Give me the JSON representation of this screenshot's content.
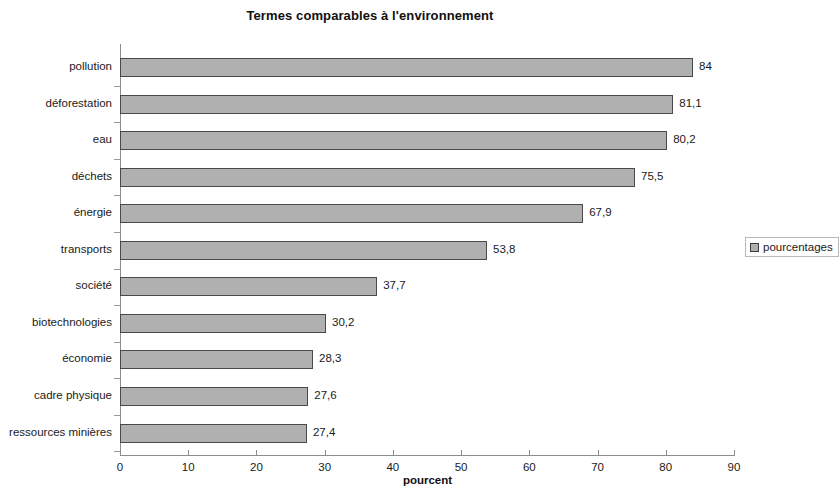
{
  "chart_data": {
    "type": "bar",
    "orientation": "horizontal",
    "title": "Termes comparables à l'environnement",
    "xlabel": "pourcent",
    "ylabel": "",
    "categories": [
      "pollution",
      "déforestation",
      "eau",
      "déchets",
      "énergie",
      "transports",
      "société",
      "biotechnologies",
      "économie",
      "cadre physique",
      "ressources minières"
    ],
    "values": [
      84,
      81.1,
      80.2,
      75.5,
      67.9,
      53.8,
      37.7,
      30.2,
      28.3,
      27.6,
      27.4
    ],
    "value_labels": [
      "84",
      "81,1",
      "80,2",
      "75,5",
      "67,9",
      "53,8",
      "37,7",
      "30,2",
      "28,3",
      "27,6",
      "27,4"
    ],
    "series": [
      {
        "name": "pourcentages",
        "values": [
          84,
          81.1,
          80.2,
          75.5,
          67.9,
          53.8,
          37.7,
          30.2,
          28.3,
          27.6,
          27.4
        ]
      }
    ],
    "xlim": [
      0,
      90
    ],
    "xticks": [
      0,
      10,
      20,
      30,
      40,
      50,
      60,
      70,
      80,
      90
    ],
    "xtick_labels": [
      "0",
      "10",
      "20",
      "30",
      "40",
      "50",
      "60",
      "70",
      "80",
      "90"
    ],
    "grid": false,
    "legend": {
      "position": "right",
      "entries": [
        "pourcentages"
      ]
    },
    "colors": {
      "bar_fill": "#b0b0b0",
      "bar_border": "#494949",
      "axis": "#8d8d8d",
      "text": "#1a1a1a",
      "background": "#ffffff"
    }
  }
}
